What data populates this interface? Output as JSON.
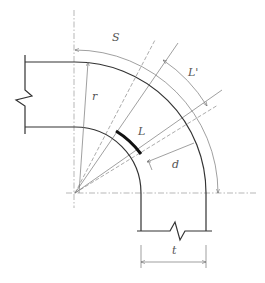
{
  "diagram": {
    "type": "pipe-bend-dimension-drawing",
    "labels": {
      "S": "S",
      "L_prime": "L'",
      "r": "r",
      "L": "L",
      "d": "d",
      "t": "t"
    },
    "colors": {
      "pipe": "#333333",
      "dimension": "#777777",
      "centerline": "#999999",
      "highlight": "#111111"
    }
  }
}
